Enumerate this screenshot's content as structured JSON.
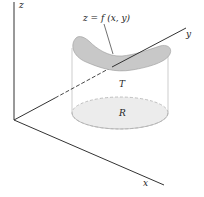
{
  "diagram": {
    "labels": {
      "z_axis": "z",
      "y_axis": "y",
      "x_axis": "x",
      "surface": "z = f (x, y)",
      "solid": "T",
      "region": "R"
    },
    "colors": {
      "axis": "#333333",
      "surface_fill": "#c8c8c8",
      "region_fill": "#ececec",
      "outline": "#aaaaaa"
    }
  }
}
